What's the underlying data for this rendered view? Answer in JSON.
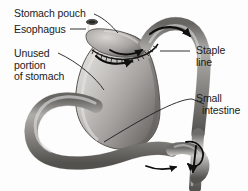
{
  "figure": {
    "style": "grayscale medical line-and-wash drawing",
    "background_color": "#fdfdfd",
    "ink_color": "#1b1b1b",
    "organ_fill_light": "#d8d6d4",
    "organ_fill_mid": "#9c9a98",
    "organ_fill_dark": "#4f4d4c"
  },
  "labels": {
    "stomach_pouch": "Stomach pouch",
    "esophagus": "Esophagus",
    "unused_line1": "Unused",
    "unused_line2": "portion",
    "unused_line3": "of stomach",
    "staple_line1": "Staple",
    "staple_line2": "line",
    "small_intestine_line1": "Small",
    "small_intestine_line2": "intestine"
  },
  "anatomy_parts": [
    "esophagus",
    "stomach-pouch",
    "staple-line",
    "unused-stomach-body",
    "duodenum-loop",
    "roux-limb",
    "small-intestine",
    "jejunojejunal-anastomosis"
  ],
  "flow_arrows": [
    "arrow-pouch-outflow-left",
    "arrow-pouch-outflow-right",
    "arrow-roux-limb-over-top",
    "arrow-distal-downward",
    "arrow-anastomosis-loop",
    "arrow-lower-bowel"
  ]
}
